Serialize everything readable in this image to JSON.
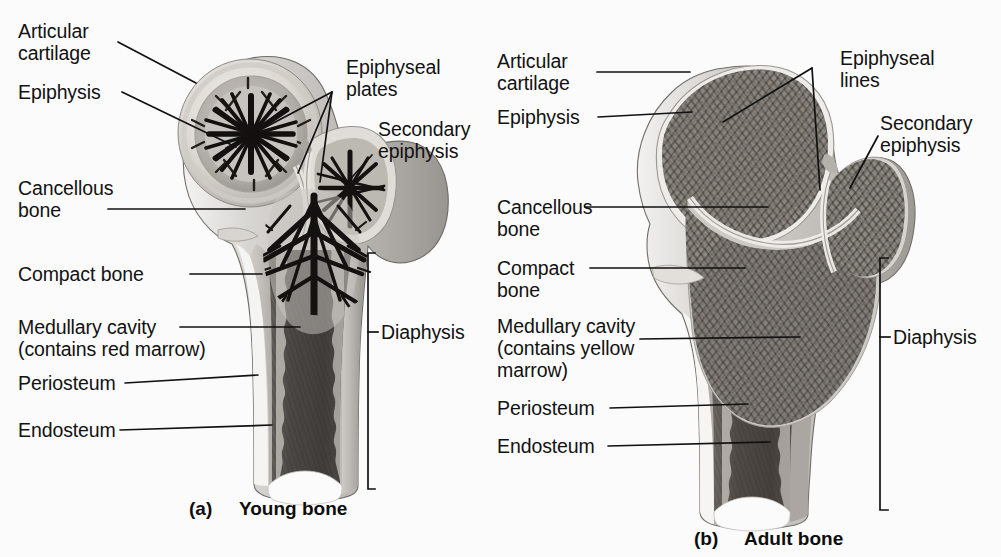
{
  "figure": {
    "background": "#fbfbfb",
    "ink": "#121212"
  },
  "panels": [
    {
      "id": "a",
      "marker": "(a)",
      "caption": "Young bone",
      "labels": [
        {
          "name": "articular-cartilage",
          "text": "Articular\ncartilage"
        },
        {
          "name": "epiphysis",
          "text": "Epiphysis"
        },
        {
          "name": "epiphyseal-plates",
          "text": "Epiphyseal\nplates"
        },
        {
          "name": "secondary-epiphysis",
          "text": "Secondary\nepiphysis"
        },
        {
          "name": "cancellous-bone",
          "text": "Cancellous\nbone"
        },
        {
          "name": "compact-bone",
          "text": "Compact bone"
        },
        {
          "name": "medullary-cavity",
          "text": "Medullary cavity\n(contains red marrow)"
        },
        {
          "name": "periosteum",
          "text": "Periosteum"
        },
        {
          "name": "endosteum",
          "text": "Endosteum"
        },
        {
          "name": "diaphysis",
          "text": "Diaphysis"
        }
      ]
    },
    {
      "id": "b",
      "marker": "(b)",
      "caption": "Adult bone",
      "labels": [
        {
          "name": "articular-cartilage",
          "text": "Articular\ncartilage"
        },
        {
          "name": "epiphysis",
          "text": "Epiphysis"
        },
        {
          "name": "epiphyseal-lines",
          "text": "Epiphyseal\nlines"
        },
        {
          "name": "secondary-epiphysis",
          "text": "Secondary\nepiphysis"
        },
        {
          "name": "cancellous-bone",
          "text": "Cancellous\nbone"
        },
        {
          "name": "compact-bone",
          "text": "Compact\nbone"
        },
        {
          "name": "medullary-cavity",
          "text": "Medullary cavity\n(contains yellow\nmarrow)"
        },
        {
          "name": "periosteum",
          "text": "Periosteum"
        },
        {
          "name": "endosteum",
          "text": "Endosteum"
        },
        {
          "name": "diaphysis",
          "text": "Diaphysis"
        }
      ]
    }
  ],
  "text": {
    "a_articular_cartilage": "Articular\ncartilage",
    "a_epiphysis": "Epiphysis",
    "a_epiphyseal_plates": "Epiphyseal\nplates",
    "a_secondary_epiphysis": "Secondary\nepiphysis",
    "a_cancellous_bone": "Cancellous\nbone",
    "a_compact_bone": "Compact bone",
    "a_medullary_cavity": "Medullary cavity\n(contains red marrow)",
    "a_periosteum": "Periosteum",
    "a_endosteum": "Endosteum",
    "a_diaphysis": "Diaphysis",
    "a_marker": "(a)",
    "a_caption": "Young bone",
    "b_articular_cartilage": "Articular\ncartilage",
    "b_epiphysis": "Epiphysis",
    "b_epiphyseal_lines": "Epiphyseal\nlines",
    "b_secondary_epiphysis": "Secondary\nepiphysis",
    "b_cancellous_bone": "Cancellous\nbone",
    "b_compact_bone": "Compact\nbone",
    "b_medullary_cavity": "Medullary cavity\n(contains yellow\nmarrow)",
    "b_periosteum": "Periosteum",
    "b_endosteum": "Endosteum",
    "b_diaphysis": "Diaphysis",
    "b_marker": "(b)",
    "b_caption": "Adult bone"
  }
}
